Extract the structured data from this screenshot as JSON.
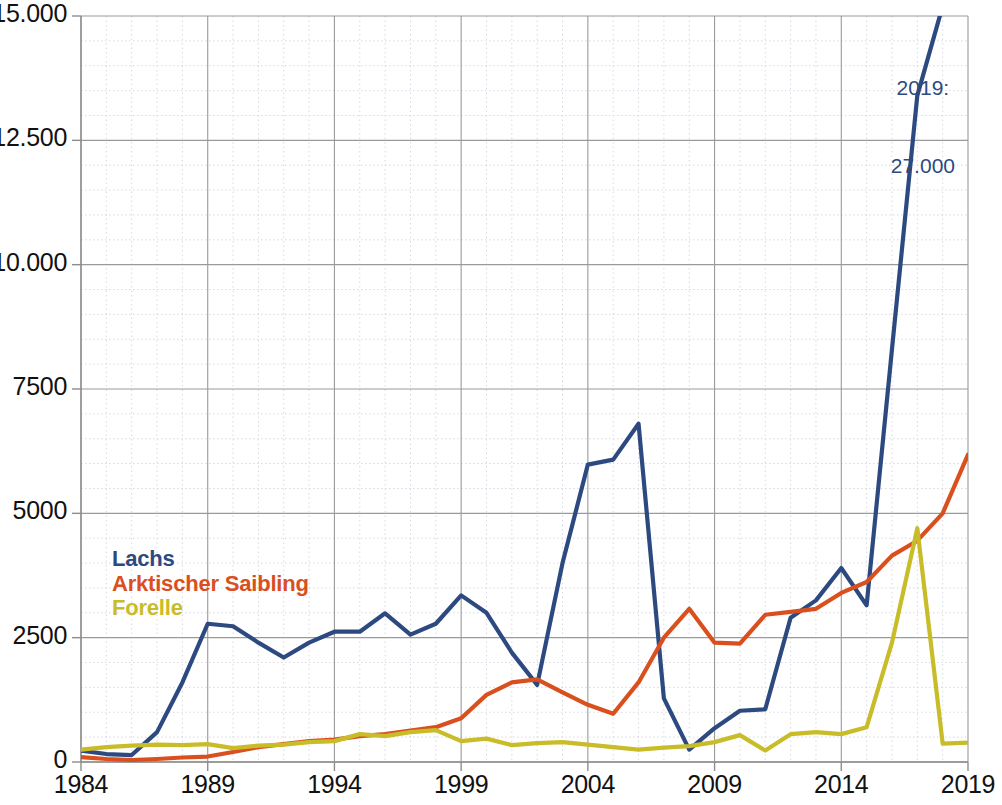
{
  "chart_data": {
    "type": "line",
    "title": "",
    "subtitle": "",
    "xlabel": "",
    "ylabel": "",
    "x": [
      1984,
      1985,
      1986,
      1987,
      1988,
      1989,
      1990,
      1991,
      1992,
      1993,
      1994,
      1995,
      1996,
      1997,
      1998,
      1999,
      2000,
      2001,
      2002,
      2003,
      2004,
      2005,
      2006,
      2007,
      2008,
      2009,
      2010,
      2011,
      2012,
      2013,
      2014,
      2015,
      2016,
      2017,
      2018,
      2019
    ],
    "xlim": [
      1984,
      2019
    ],
    "ylim": [
      0,
      15000
    ],
    "xticks": [
      1984,
      1989,
      1994,
      1999,
      2004,
      2009,
      2014,
      2019
    ],
    "xticklabels": [
      "1984",
      "1989",
      "1994",
      "1999",
      "2004",
      "2009",
      "2014",
      "2019"
    ],
    "yticks": [
      0,
      2500,
      5000,
      7500,
      10000,
      12500,
      15000
    ],
    "yticklabels": [
      "0",
      "2500",
      "5000",
      "7500",
      "10.000",
      "12.500",
      "15.000"
    ],
    "minor_ytick_step": 500,
    "grid": "major solid gray, minor dotted light",
    "legend_position": "inside left, middle-lower",
    "series": [
      {
        "name": "Lachs",
        "color": "#2d4a80",
        "values": [
          230,
          160,
          140,
          600,
          1600,
          2780,
          2730,
          2400,
          2100,
          2400,
          2620,
          2620,
          2990,
          2560,
          2780,
          3350,
          3000,
          2200,
          1550,
          4000,
          5980,
          6080,
          6800,
          1280,
          250,
          680,
          1030,
          1060,
          2900,
          3250,
          3900,
          3150,
          8300,
          13400,
          15200,
          27000
        ],
        "clipped_above": true,
        "clip_value": 15000,
        "final_value": 27000
      },
      {
        "name": "Arktischer Saibling",
        "color": "#d9501e",
        "values": [
          100,
          60,
          40,
          60,
          90,
          110,
          200,
          300,
          360,
          420,
          450,
          520,
          560,
          630,
          700,
          880,
          1350,
          1600,
          1660,
          1400,
          1150,
          970,
          1600,
          2500,
          3080,
          2400,
          2380,
          2960,
          3020,
          3080,
          3400,
          3620,
          4150,
          4450,
          5000,
          6180
        ],
        "clipped_above": false
      },
      {
        "name": "Forelle",
        "color": "#c8bc28",
        "values": [
          250,
          300,
          330,
          350,
          340,
          360,
          280,
          330,
          350,
          400,
          420,
          560,
          520,
          600,
          640,
          420,
          470,
          340,
          380,
          400,
          350,
          300,
          250,
          290,
          320,
          400,
          540,
          230,
          560,
          600,
          560,
          700,
          2400,
          4700,
          370,
          390
        ],
        "clipped_above": false
      }
    ],
    "annotations": [
      {
        "name": "lachs-2019-callout",
        "text": "2019:\n27.000",
        "color": "#2d4a80",
        "series": "Lachs",
        "x": 2019,
        "value": 27000
      }
    ]
  },
  "legend": {
    "items": [
      {
        "label": "Lachs",
        "color": "#2d4a80"
      },
      {
        "label": "Arktischer Saibling",
        "color": "#d9501e"
      },
      {
        "label": "Forelle",
        "color": "#c8bc28"
      }
    ]
  },
  "annotation": {
    "line1": "2019:",
    "line2": "27.000",
    "color": "#2d4a80"
  },
  "axes": {
    "y_tick_labels": [
      "15.000",
      "12.500",
      "10.000",
      "7500",
      "5000",
      "2500",
      "0"
    ],
    "x_tick_labels": [
      "1984",
      "1989",
      "1994",
      "1999",
      "2004",
      "2009",
      "2014",
      "2019"
    ]
  },
  "colors": {
    "lachs": "#2d4a80",
    "saibling": "#d9501e",
    "forelle": "#c8bc28",
    "grid_major": "#9a9a9a",
    "grid_minor": "#d8d8e4",
    "axis": "#8d8d8d",
    "text": "#111111",
    "background": "#ffffff"
  }
}
